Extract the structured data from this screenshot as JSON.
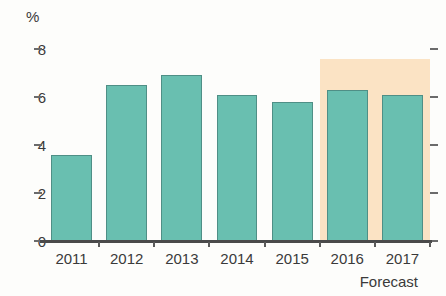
{
  "chart_data": {
    "type": "bar",
    "title": "",
    "subtitle": "",
    "xlabel": "",
    "ylabel": "%",
    "categories": [
      "2011",
      "2012",
      "2013",
      "2014",
      "2015",
      "2016",
      "2017"
    ],
    "values": [
      3.6,
      6.5,
      6.9,
      6.1,
      5.8,
      6.3,
      6.1
    ],
    "series": [
      {
        "name": "Growth rate",
        "values": [
          3.6,
          6.5,
          6.9,
          6.1,
          5.8,
          6.3,
          6.1
        ]
      }
    ],
    "ylim": [
      0,
      8
    ],
    "y_ticks": [
      0,
      2,
      4,
      6,
      8
    ],
    "y_tick_labels": [
      "0",
      "2",
      "4",
      "6",
      "8"
    ],
    "grid": false,
    "legend_position": "none",
    "annotations": [
      {
        "text": "Forecast",
        "applies_to": [
          "2016",
          "2017"
        ],
        "region_start_category": "2016",
        "region_end_category": "2017",
        "region_top_value": 7.6
      }
    ],
    "colors": {
      "bar_fill": "#69bfb0",
      "bar_stroke": "#4f8f86",
      "forecast_band": "#fbe3c4",
      "axis": "#4a4a4a",
      "text": "#3a3a3a",
      "background": "#fdfdfb"
    }
  },
  "axis": {
    "unit_label": "%",
    "y_labels": [
      "8",
      "6",
      "4",
      "2",
      "0"
    ]
  },
  "x_labels": [
    "2011",
    "2012",
    "2013",
    "2014",
    "2015",
    "2016",
    "2017"
  ],
  "forecast": {
    "caption": "Forecast"
  }
}
